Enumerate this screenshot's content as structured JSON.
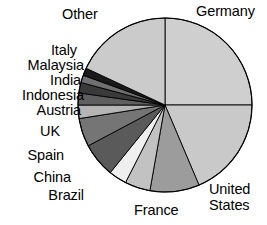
{
  "chart_data": {
    "type": "pie",
    "title": "",
    "subtitle": "",
    "xlabel": "",
    "ylabel": "",
    "legend_position": "none",
    "grid": false,
    "labels_outside": true,
    "start_angle_deg": 0,
    "direction": "clockwise",
    "center": {
      "x": 165,
      "y": 105
    },
    "radius": 87,
    "categories": [
      "Germany",
      "United States",
      "France",
      "Brazil",
      "China",
      "Spain",
      "UK",
      "Austria",
      "Indonesia",
      "India",
      "Malaysia",
      "Italy",
      "Other"
    ],
    "values": [
      25.0,
      18.6,
      9.2,
      4.7,
      3.3,
      6.4,
      5.3,
      2.5,
      2.2,
      1.9,
      1.4,
      1.4,
      18.1
    ],
    "angles_deg": [
      90.0,
      67.0,
      33.0,
      17.0,
      12.0,
      23.0,
      19.0,
      9.0,
      8.0,
      7.0,
      5.0,
      5.0,
      65.0
    ],
    "slice_colors": [
      "#cfcfcf",
      "#c9c9c9",
      "#9c9c9c",
      "#c2c2c2",
      "#efefef",
      "#5a5a5a",
      "#757575",
      "#b5b5b5",
      "#5f5f5f",
      "#3a3a3a",
      "#707070",
      "#1a1a1a",
      "#cbcbcb"
    ],
    "stroke_color": "#000000",
    "background": "#ffffff"
  },
  "labels": {
    "germany": "Germany",
    "united_states_line1": "United",
    "united_states_line2": "States",
    "france": "France",
    "brazil": "Brazil",
    "china": "China",
    "spain": "Spain",
    "uk": "UK",
    "austria": "Austria",
    "indonesia": "Indonesia",
    "india": "India",
    "malaysia": "Malaysia",
    "italy": "Italy",
    "other": "Other"
  }
}
